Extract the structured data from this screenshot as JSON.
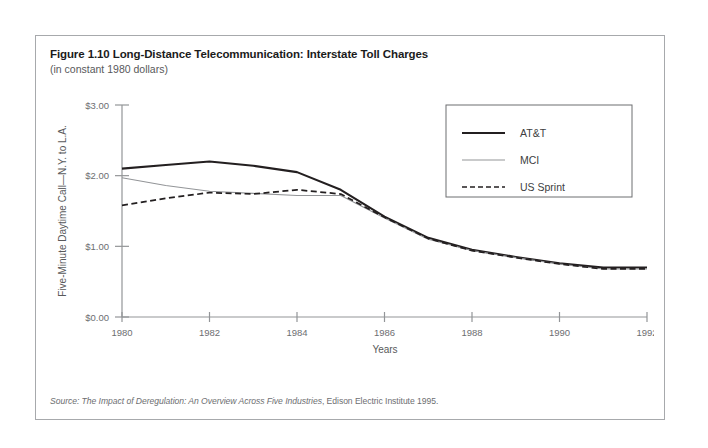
{
  "figure": {
    "title": "Figure 1.10 Long-Distance Telecommunication: Interstate Toll Charges",
    "subtitle": "(in constant 1980 dollars)",
    "source_italic": "Source: The Impact of Deregulation: An Overview Across Five Industries",
    "source_rest": ", Edison Electric Institute 1995."
  },
  "colors": {
    "frame": "#a7a9ac",
    "axis": "#939598",
    "att": "#231f20",
    "mci": "#939598",
    "sprint": "#231f20",
    "title_text": "#1b1b1b",
    "muted_text": "#6d6e71"
  },
  "legend": {
    "items": [
      {
        "label": "AT&T",
        "style": "solid-thick",
        "color": "#231f20"
      },
      {
        "label": "MCI",
        "style": "solid-thin",
        "color": "#939598"
      },
      {
        "label": "US Sprint",
        "style": "dashed",
        "color": "#231f20"
      }
    ]
  },
  "chart_data": {
    "type": "line",
    "title": "Figure 1.10 Long-Distance Telecommunication: Interstate Toll Charges",
    "subtitle": "(in constant 1980 dollars)",
    "xlabel": "Years",
    "ylabel": "Five-Minute Daytime Call—N.Y. to L.A.",
    "xlim": [
      1980,
      1992
    ],
    "ylim": [
      0.0,
      3.0
    ],
    "grid": false,
    "legend_position": "top-right",
    "x_ticks": [
      1980,
      1982,
      1984,
      1986,
      1988,
      1990,
      1992
    ],
    "x_tick_labels": [
      "1980",
      "1982",
      "1984",
      "1986",
      "1988",
      "1990",
      "1992"
    ],
    "y_ticks": [
      0.0,
      1.0,
      2.0,
      3.0
    ],
    "y_tick_labels": [
      "$0.00",
      "$1.00",
      "$2.00",
      "$3.00"
    ],
    "x": [
      1980,
      1981,
      1982,
      1983,
      1984,
      1985,
      1986,
      1987,
      1988,
      1989,
      1990,
      1991,
      1992
    ],
    "series": [
      {
        "name": "AT&T",
        "color": "#231f20",
        "style": "solid-thick",
        "values": [
          2.1,
          2.15,
          2.2,
          2.14,
          2.05,
          1.8,
          1.42,
          1.12,
          0.95,
          0.85,
          0.76,
          0.7,
          0.7
        ]
      },
      {
        "name": "MCI",
        "color": "#939598",
        "style": "solid-thin",
        "values": [
          1.97,
          1.86,
          1.78,
          1.75,
          1.72,
          1.72,
          1.4,
          1.1,
          0.94,
          0.84,
          0.75,
          0.68,
          0.68
        ]
      },
      {
        "name": "US Sprint",
        "color": "#231f20",
        "style": "dashed",
        "values": [
          1.58,
          1.68,
          1.76,
          1.74,
          1.8,
          1.74,
          1.41,
          1.11,
          0.94,
          0.84,
          0.75,
          0.68,
          0.68
        ]
      }
    ]
  }
}
